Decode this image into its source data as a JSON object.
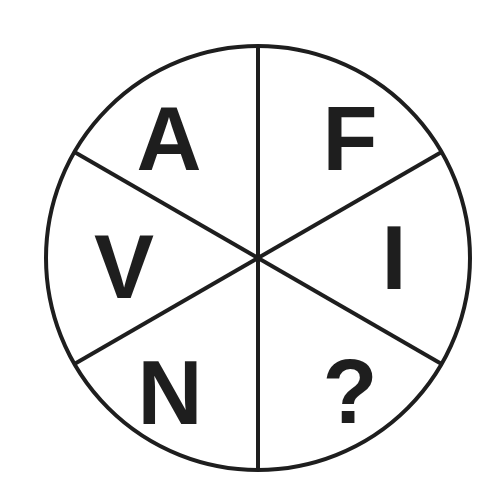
{
  "puzzle": {
    "type": "circle-sector-letter-puzzle",
    "segments": 6,
    "stroke_color": "#1e1e1e",
    "background": "#ffffff",
    "sectors": [
      {
        "position": "top-left",
        "label": "A"
      },
      {
        "position": "top-right",
        "label": "F"
      },
      {
        "position": "right",
        "label": "I"
      },
      {
        "position": "bottom-right",
        "label": "?"
      },
      {
        "position": "bottom-left",
        "label": "N"
      },
      {
        "position": "left",
        "label": "V"
      }
    ]
  }
}
